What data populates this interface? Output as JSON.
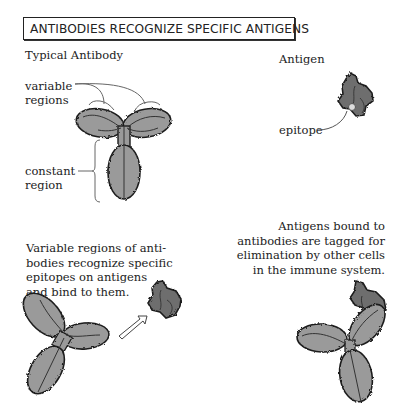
{
  "title": "ANTIBODIES RECOGNIZE SPECIFIC ANTIGENS",
  "panels": {
    "typical_antibody": {
      "heading": "Typical Antibody",
      "labels": {
        "variable_regions": [
          "variable",
          "regions"
        ],
        "constant_region": [
          "constant",
          "region"
        ]
      }
    },
    "antigen": {
      "heading": "Antigen",
      "labels": {
        "epitope": "epitope"
      }
    },
    "binding": {
      "caption": [
        "Variable regions of anti-",
        "bodies recognize specific",
        "epitopes on antigens",
        "and bind to them."
      ]
    },
    "tagged": {
      "caption": [
        "Antigens bound to",
        "antibodies are tagged for",
        "elimination by other cells",
        "in the immune system."
      ]
    }
  },
  "colors": {
    "antibody_fill": "#9a9a9a",
    "antigen_fill": "#6e6e6e",
    "outline": "#1e1e1e",
    "line": "#444444"
  }
}
